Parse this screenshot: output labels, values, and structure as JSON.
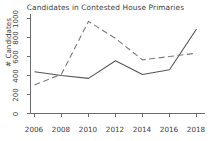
{
  "chart_data": {
    "type": "line",
    "title": "Candidates in Contested House Primaries",
    "xlabel": "",
    "ylabel": "# Candidates",
    "x": [
      2006,
      2008,
      2010,
      2012,
      2014,
      2016,
      2018
    ],
    "xticklabels": [
      "2006",
      "2008",
      "2010",
      "2012",
      "2014",
      "2016",
      "2018"
    ],
    "yticklabels": [
      "0",
      "200",
      "400",
      "600",
      "800",
      "1000"
    ],
    "yticks": [
      0,
      200,
      400,
      600,
      800,
      1000
    ],
    "ylim": [
      0,
      1060
    ],
    "xlim": [
      2005.2,
      2018.8
    ],
    "grid": false,
    "legend": "none",
    "series": [
      {
        "name": "solid-series",
        "style": "solid",
        "color": "#555555",
        "values": [
          440,
          400,
          370,
          555,
          410,
          460,
          890
        ]
      },
      {
        "name": "dashed-series",
        "style": "dashed",
        "color": "#7a7a7a",
        "values": [
          300,
          415,
          970,
          790,
          565,
          600,
          635
        ]
      }
    ]
  },
  "axes": {
    "title": "Candidates in Contested House Primaries",
    "ylabel": "# Candidates",
    "ytick_labels": [
      "1000",
      "800",
      "600",
      "400",
      "200",
      "0"
    ],
    "xtick_labels": [
      "2006",
      "2008",
      "2010",
      "2012",
      "2014",
      "2016",
      "2018"
    ]
  }
}
